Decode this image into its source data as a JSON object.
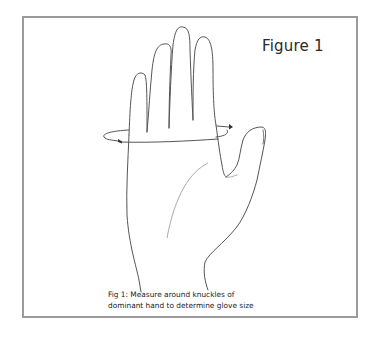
{
  "figure": {
    "title": "Figure 1",
    "caption_line1": "Fig 1: Measure around knuckles of",
    "caption_line2": "dominant hand to determine glove size"
  },
  "illustration": {
    "subject": "hand-outline",
    "annotation": "measurement-loop-around-knuckles",
    "colors": {
      "frame_border": "#9b9b9b",
      "line": "#555555",
      "palm_crease": "#aaaaaa",
      "background": "#ffffff"
    }
  }
}
